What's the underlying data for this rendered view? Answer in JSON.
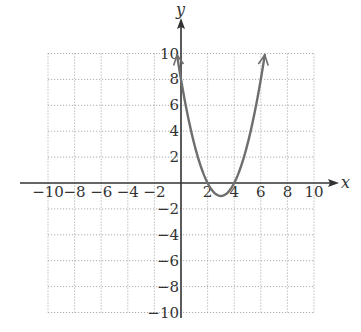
{
  "chart_data": {
    "type": "line",
    "title": "",
    "xlabel": "x",
    "ylabel": "y",
    "xlim": [
      -10,
      10
    ],
    "ylim": [
      -10,
      10
    ],
    "grid": true,
    "grid_style": "dotted",
    "x_ticks": [
      -10,
      -8,
      -6,
      -4,
      -2,
      2,
      4,
      6,
      8,
      10
    ],
    "y_ticks": [
      -10,
      -8,
      -6,
      -4,
      -2,
      2,
      4,
      6,
      8,
      10
    ],
    "series": [
      {
        "name": "y = x^2 - 6x + 8",
        "equation": "y = x^2 - 6x + 8",
        "color": "#6e6e6e",
        "x_range": [
          -0.3,
          6.3
        ],
        "arrows_both_ends": true,
        "key_points": [
          {
            "x": 0,
            "y": 8
          },
          {
            "x": 2,
            "y": 0
          },
          {
            "x": 3,
            "y": -1
          },
          {
            "x": 4,
            "y": 0
          },
          {
            "x": 6,
            "y": 8
          }
        ]
      }
    ]
  },
  "labels": {
    "x_axis": "x",
    "y_axis": "y",
    "x_tick_labels": [
      "−10",
      "−8",
      "−6",
      "−4",
      "−2",
      "2",
      "4",
      "6",
      "8",
      "10"
    ],
    "y_tick_labels_pos": [
      "2",
      "4",
      "6",
      "8",
      "10"
    ],
    "y_tick_labels_neg": [
      "−2",
      "−4",
      "−6",
      "−8",
      "−10"
    ]
  },
  "colors": {
    "grid": "#9a9a9a",
    "axis": "#333333",
    "curve": "#6e6e6e"
  }
}
